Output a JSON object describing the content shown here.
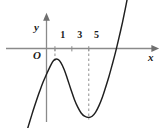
{
  "figure": {
    "type": "function-graph",
    "background_color": "#ffffff",
    "axis_color": "#808080",
    "curve_color": "#1a1a1a",
    "dash_color": "#9a9a9a",
    "text_color": "#1a1a1a",
    "origin_label": "O",
    "x_axis_label": "x",
    "y_axis_label": "y"
  },
  "chart_data": {
    "type": "line",
    "title": "",
    "xlabel": "x",
    "ylabel": "y",
    "grid": false,
    "legend": null,
    "x_ticks": [
      1,
      3,
      5
    ],
    "x_tick_labels": [
      "1",
      "3",
      "5"
    ],
    "y_ticks": [],
    "y_tick_labels": [],
    "xlim": [
      -2.4,
      11.6
    ],
    "ylim": [
      -7.6,
      5.4
    ],
    "annotations": [
      {
        "text": "O",
        "role": "origin-label",
        "x": -0.55,
        "y": -0.85
      },
      {
        "text": "x",
        "role": "x-axis-label",
        "x": 11.2,
        "y": -1.0
      },
      {
        "text": "y",
        "role": "y-axis-label",
        "x": -0.95,
        "y": 3.55
      }
    ],
    "dashed_guides": [
      {
        "x": 1,
        "y_from": 0,
        "y_to": -0.85,
        "style": "dashed"
      },
      {
        "x": 5,
        "y_from": 0,
        "y_to": -5.35,
        "style": "dashed"
      }
    ],
    "features": {
      "local_maximum": {
        "x": 1,
        "y": -0.85
      },
      "local_minimum": {
        "x": 5,
        "y": -5.35
      },
      "x_intercept": 9.0
    },
    "series": [
      {
        "name": "f(x)",
        "points": [
          [
            -2.35,
            -6.45
          ],
          [
            -2.0,
            -5.7
          ],
          [
            -1.6,
            -4.85
          ],
          [
            -1.2,
            -4.05
          ],
          [
            -0.8,
            -3.3
          ],
          [
            -0.4,
            -2.6
          ],
          [
            0.0,
            -2.0
          ],
          [
            0.35,
            -1.5
          ],
          [
            0.7,
            -1.05
          ],
          [
            1.0,
            -0.85
          ],
          [
            1.35,
            -0.85
          ],
          [
            1.7,
            -1.1
          ],
          [
            2.1,
            -1.65
          ],
          [
            2.5,
            -2.4
          ],
          [
            2.9,
            -3.2
          ],
          [
            3.3,
            -3.95
          ],
          [
            3.7,
            -4.55
          ],
          [
            4.1,
            -5.0
          ],
          [
            4.5,
            -5.25
          ],
          [
            5.0,
            -5.35
          ],
          [
            5.4,
            -5.25
          ],
          [
            5.8,
            -4.95
          ],
          [
            6.2,
            -4.45
          ],
          [
            6.6,
            -3.8
          ],
          [
            7.0,
            -3.0
          ],
          [
            7.4,
            -2.15
          ],
          [
            7.8,
            -1.2
          ],
          [
            8.2,
            -0.2
          ],
          [
            8.6,
            0.9
          ],
          [
            9.0,
            2.05
          ],
          [
            9.3,
            3.0
          ],
          [
            9.6,
            4.0
          ],
          [
            9.85,
            4.9
          ]
        ]
      }
    ]
  }
}
